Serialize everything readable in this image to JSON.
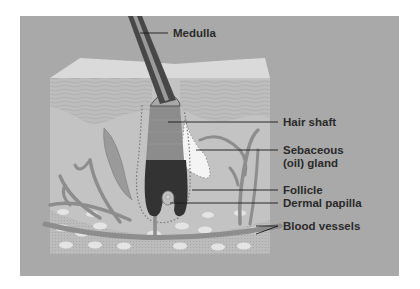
{
  "diagram": {
    "labels": {
      "medulla": "Medulla",
      "hair_shaft": "Hair shaft",
      "sebaceous_line1": "Sebaceous",
      "sebaceous_line2": "(oil) gland",
      "follicle": "Follicle",
      "dermal_papilla": "Dermal papilla",
      "blood_vessels": "Blood vessels"
    },
    "colors": {
      "background": "#a9a9a9",
      "epidermis_top": "#d9d9d9",
      "dermis": "#c4c4c4",
      "hair": "#3a3a3a",
      "vessels": "#8f8f8f",
      "label_text": "#2a2a2a"
    }
  }
}
